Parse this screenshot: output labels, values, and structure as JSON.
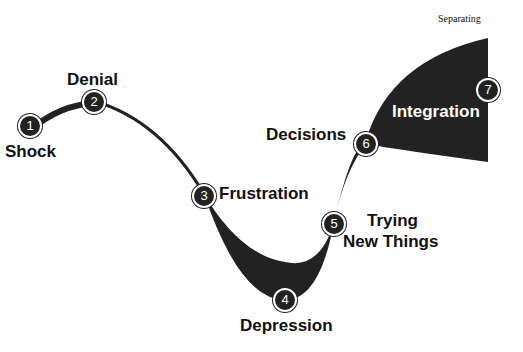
{
  "title": "Separating",
  "colors": {
    "fill": "#222222",
    "text": "#111111",
    "background": "#ffffff"
  },
  "stages": [
    {
      "n": "1",
      "label": "Shock"
    },
    {
      "n": "2",
      "label": "Denial"
    },
    {
      "n": "3",
      "label": "Frustration"
    },
    {
      "n": "4",
      "label": "Depression"
    },
    {
      "n": "5",
      "label": "Trying",
      "label2": "New Things"
    },
    {
      "n": "6",
      "label": "Decisions"
    },
    {
      "n": "7",
      "label": "Integration"
    }
  ]
}
